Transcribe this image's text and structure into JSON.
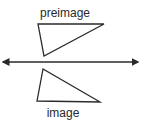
{
  "diagram": {
    "preimage_label": "preimage",
    "image_label": "image",
    "stroke_color": "#2a2a2a",
    "background": "#ffffff",
    "preimage_triangle": {
      "points": [
        [
          38,
          24
        ],
        [
          104,
          24
        ],
        [
          44,
          56
        ]
      ]
    },
    "image_triangle": {
      "points": [
        [
          43,
          69
        ],
        [
          37,
          101
        ],
        [
          100,
          102
        ]
      ]
    },
    "line_of_reflection": {
      "x1": 3,
      "y1": 62,
      "x2": 138,
      "y2": 62,
      "arrowheads": "both"
    }
  }
}
